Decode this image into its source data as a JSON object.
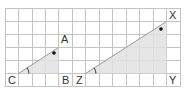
{
  "triangles": [
    {
      "name": "ABC",
      "vertices": {
        "A": "A",
        "B": "B",
        "C": "C"
      },
      "right_angle_at": "B",
      "marked_angle_at": "C"
    },
    {
      "name": "XYZ",
      "vertices": {
        "X": "X",
        "Y": "Y",
        "Z": "Z"
      },
      "right_angle_at": "Y",
      "marked_angle_at": "Z"
    }
  ],
  "labels": {
    "A": "A",
    "B": "B",
    "C": "C",
    "X": "X",
    "Y": "Y",
    "Z": "Z"
  },
  "colors": {
    "grid": "#bdbdbd",
    "fill": "#e3e3e3",
    "line": "#9a9a9a",
    "text": "#333333"
  }
}
